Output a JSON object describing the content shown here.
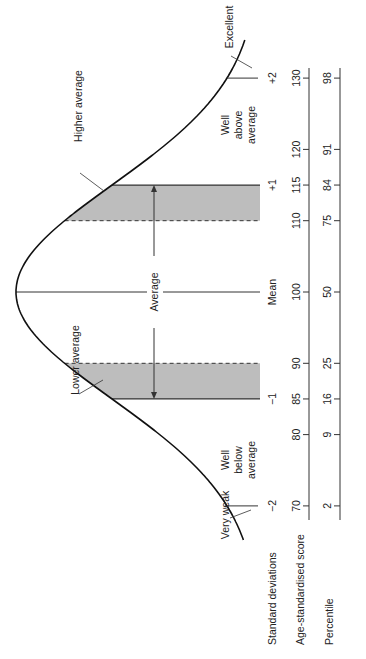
{
  "row_labels": {
    "standard_deviations": "Standard deviations",
    "age_standardised_score": "Age-standardised score",
    "percentile": "Percentile"
  },
  "band_labels": {
    "very_weak": "Very weak",
    "well_below_average": [
      "Well",
      "below",
      "average"
    ],
    "lower_average": "Lower average",
    "average": "Average",
    "higher_average": "Higher average",
    "well_above_average": [
      "Well",
      "above",
      "average"
    ],
    "excellent": "Excellent"
  },
  "standard_deviation_ticks": [
    {
      "label": "−2",
      "score": 70
    },
    {
      "label": "−1",
      "score": 85
    },
    {
      "label": "Mean",
      "score": 100
    },
    {
      "label": "+1",
      "score": 115
    },
    {
      "label": "+2",
      "score": 130
    }
  ],
  "score_ticks": [
    {
      "score": 70,
      "label": "70"
    },
    {
      "score": 80,
      "label": "80"
    },
    {
      "score": 85,
      "label": "85"
    },
    {
      "score": 90,
      "label": "90"
    },
    {
      "score": 100,
      "label": "100"
    },
    {
      "score": 110,
      "label": "110"
    },
    {
      "score": 115,
      "label": "115"
    },
    {
      "score": 120,
      "label": "120"
    },
    {
      "score": 130,
      "label": "130"
    }
  ],
  "percentile_ticks": [
    {
      "score": 70,
      "label": "2"
    },
    {
      "score": 80,
      "label": "9"
    },
    {
      "score": 85,
      "label": "16"
    },
    {
      "score": 90,
      "label": "25"
    },
    {
      "score": 100,
      "label": "50"
    },
    {
      "score": 110,
      "label": "75"
    },
    {
      "score": 115,
      "label": "84"
    },
    {
      "score": 120,
      "label": "91"
    },
    {
      "score": 130,
      "label": "98"
    }
  ],
  "shaded_regions": [
    {
      "name": "lower-average",
      "from_score": 85,
      "to_score": 90
    },
    {
      "name": "higher-average",
      "from_score": 110,
      "to_score": 115
    }
  ],
  "colors": {
    "curve": "#111111",
    "shade": "#bdbdbd",
    "lines": "#333333",
    "text": "#222222"
  }
}
